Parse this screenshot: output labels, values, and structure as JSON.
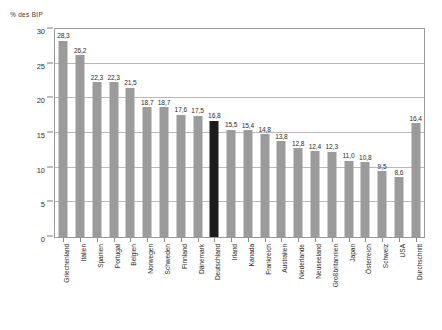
{
  "chart_data": {
    "type": "bar",
    "title": "",
    "subtitle": "",
    "xlabel": "",
    "ylabel": "% des BIP",
    "ylim": [
      0,
      30
    ],
    "ytick_values": [
      0,
      5,
      10,
      15,
      20,
      25,
      30
    ],
    "ytick_labels": [
      "0",
      "5",
      "10",
      "15",
      "20",
      "25",
      "30"
    ],
    "grid": true,
    "legend": "none",
    "decimal_separator": ",",
    "highlight_color": "#1c1c1c",
    "bar_color": "#9b9b9b",
    "highlighted_category": "Deutschland",
    "categories": [
      "Griechenland",
      "Italien",
      "Spanien",
      "Portugal",
      "Belgien",
      "Norwegen",
      "Schweden",
      "Finnland",
      "Dänemark",
      "Deutschland",
      "Irland",
      "Kanada",
      "Frankreich",
      "Australien",
      "Niederlande",
      "Neuseeland",
      "Großbritannien",
      "Japan",
      "Österreich",
      "Schweiz",
      "USA",
      "Durchschnitt"
    ],
    "values": [
      28.3,
      26.2,
      22.3,
      22.3,
      21.5,
      18.7,
      18.7,
      17.6,
      17.5,
      16.8,
      15.5,
      15.4,
      14.8,
      13.8,
      12.8,
      12.4,
      12.3,
      11.0,
      10.8,
      9.5,
      8.6,
      16.4
    ],
    "value_labels": [
      "28,3",
      "26,2",
      "22,3",
      "22,3",
      "21,5",
      "18,7",
      "18,7",
      "17,6",
      "17,5",
      "16,8",
      "15,5",
      "15,4",
      "14,8",
      "13,8",
      "12,8",
      "12,4",
      "12,3",
      "11,0",
      "10,8",
      "9,5",
      "8,6",
      "16,4"
    ],
    "highlighted_indices": [
      9
    ]
  }
}
